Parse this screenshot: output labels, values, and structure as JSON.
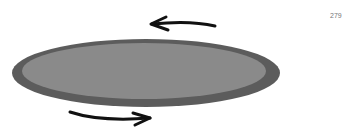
{
  "page": {
    "number": "279"
  },
  "diagram": {
    "disk": {
      "fill": "#8a8a8a",
      "rim": "#5c5c5c"
    },
    "arrows": [
      {
        "position": "top",
        "direction": "left",
        "color": "#111111"
      },
      {
        "position": "bottom",
        "direction": "right",
        "color": "#111111"
      }
    ]
  }
}
